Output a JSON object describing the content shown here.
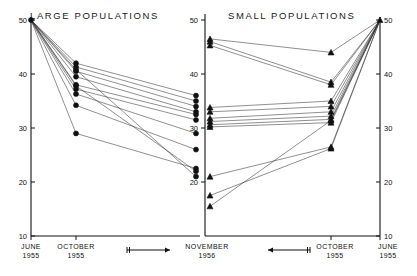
{
  "panels": {
    "left": {
      "title": "LARGE POPULATIONS",
      "marker": "filled-circle"
    },
    "right": {
      "title": "SMALL POPULATIONS",
      "marker": "filled-triangle"
    }
  },
  "axis": {
    "y_ticks": [
      "50",
      "40",
      "30",
      "20",
      "10"
    ],
    "y_values": [
      50,
      40,
      30,
      20,
      10
    ],
    "x_labels_left": [
      {
        "line1": "JUNE",
        "line2": "1955"
      },
      {
        "line1": "OCTOBER",
        "line2": "1955"
      },
      {
        "line1": "NOVEMBER",
        "line2": "1956"
      }
    ],
    "x_labels_right": [
      {
        "line1": "NOVEMBER",
        "line2": "1956"
      },
      {
        "line1": "OCTOBER",
        "line2": "1955"
      },
      {
        "line1": "JUNE",
        "line2": "1955"
      }
    ],
    "inner_ticks_center": [
      "50",
      "40",
      "30",
      "20"
    ]
  },
  "chart_data": {
    "type": "line",
    "subtitle": "",
    "xlabel": "",
    "ylabel": "",
    "ylim": [
      10,
      50
    ],
    "grid": false,
    "legend_position": "none",
    "annotations": [
      {
        "text": "arrow-left-panel",
        "direction": "right"
      },
      {
        "text": "arrow-right-panel",
        "direction": "left"
      }
    ],
    "panels": [
      {
        "name": "LARGE POPULATIONS",
        "marker": "circle",
        "categories": [
          "JUNE 1955",
          "OCTOBER 1955",
          "NOVEMBER 1956"
        ],
        "x_order": "left-to-right",
        "series": [
          {
            "name": "L1",
            "values": [
              50,
              42.0,
              36.0
            ]
          },
          {
            "name": "L2",
            "values": [
              50,
              41.3,
              35.0
            ]
          },
          {
            "name": "L3",
            "values": [
              50,
              40.5,
              34.0
            ]
          },
          {
            "name": "L4",
            "values": [
              50,
              39.5,
              33.0
            ]
          },
          {
            "name": "L5",
            "values": [
              50,
              38.0,
              32.5
            ]
          },
          {
            "name": "L6",
            "values": [
              50,
              37.2,
              31.5
            ]
          },
          {
            "name": "L7",
            "values": [
              50,
              36.3,
              29.0
            ]
          },
          {
            "name": "L8",
            "values": [
              50,
              34.2,
              26.0
            ]
          },
          {
            "name": "L9",
            "values": [
              50,
              29.0,
              22.5
            ]
          },
          {
            "name": "L10",
            "values": [
              50,
              37.8,
              22.0
            ]
          },
          {
            "name": "L11",
            "values": [
              50,
              40.8,
              21.0
            ]
          }
        ]
      },
      {
        "name": "SMALL POPULATIONS",
        "marker": "triangle",
        "categories": [
          "NOVEMBER 1956",
          "OCTOBER 1955",
          "JUNE 1955"
        ],
        "x_order": "right-to-left-time",
        "series": [
          {
            "name": "S1",
            "values": [
              46.5,
              44.0,
              50
            ]
          },
          {
            "name": "S2",
            "values": [
              46.0,
              38.5,
              50
            ]
          },
          {
            "name": "S3",
            "values": [
              45.3,
              38.0,
              50
            ]
          },
          {
            "name": "S4",
            "values": [
              33.8,
              35.0,
              50
            ]
          },
          {
            "name": "S5",
            "values": [
              33.0,
              34.0,
              50
            ]
          },
          {
            "name": "S6",
            "values": [
              31.8,
              33.0,
              50
            ]
          },
          {
            "name": "S7",
            "values": [
              31.2,
              32.2,
              50
            ]
          },
          {
            "name": "S8",
            "values": [
              30.6,
              31.6,
              50
            ]
          },
          {
            "name": "S9",
            "values": [
              30.2,
              31.0,
              50
            ]
          },
          {
            "name": "S10",
            "values": [
              21.0,
              26.5,
              50
            ]
          },
          {
            "name": "S11",
            "values": [
              17.5,
              26.2,
              50
            ]
          },
          {
            "name": "S12",
            "values": [
              15.5,
              31.4,
              50
            ]
          }
        ]
      }
    ]
  }
}
